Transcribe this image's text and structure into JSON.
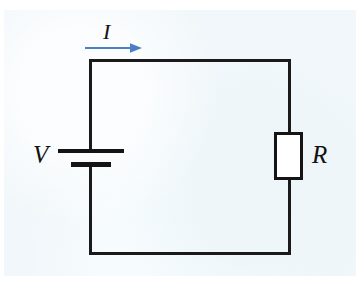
{
  "figure": {
    "kind": "circuit-diagram",
    "background_color": "#f1f7fa",
    "page_color": "#ffffff",
    "ink_color": "#1a1a1a"
  },
  "labels": {
    "voltage": "V",
    "resistance": "R",
    "current": "I"
  },
  "components": [
    {
      "name": "battery",
      "symbol": "dc-voltage-source",
      "label": "V",
      "position": "left",
      "terminals": {
        "long_plate": "positive",
        "short_plate": "negative"
      }
    },
    {
      "name": "resistor",
      "symbol": "rectangular-resistor",
      "label": "R",
      "position": "right",
      "fill_color": "#ffffff",
      "border_color": "#141414"
    },
    {
      "name": "current-arrow",
      "symbol": "direction-arrow",
      "label": "I",
      "position": "top",
      "direction": "rightward",
      "color": "#4a7fc8"
    }
  ],
  "wires": {
    "count": 4,
    "shape": "rectangular-loop",
    "color": "#1a1a1a"
  }
}
